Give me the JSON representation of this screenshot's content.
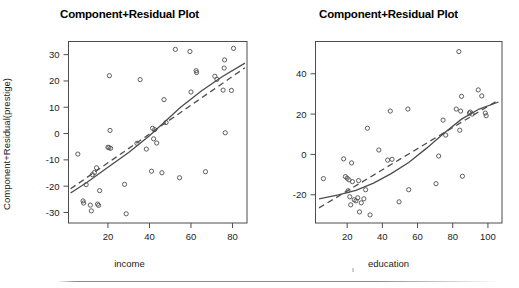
{
  "figure": {
    "background_color": "#ffffff",
    "ink_color": "#4d4d4d",
    "text_color": "#1c1c1c",
    "bottom_rule_visible": true
  },
  "panels": [
    {
      "id": "income-panel",
      "title": "Component+Residual Plot",
      "xlabel": "income",
      "ylabel": "Component+Residual(prestige)",
      "xticks": [
        20,
        40,
        60,
        80
      ],
      "yticks": [
        -30,
        -20,
        -10,
        0,
        10,
        20,
        30
      ],
      "xlim": [
        1,
        87
      ],
      "ylim": [
        -34,
        35
      ]
    },
    {
      "id": "education-panel",
      "title": "Component+Residual Plot",
      "xlabel": "education",
      "ylabel": "Component+Residual(prestige)",
      "xticks": [
        20,
        40,
        60,
        80,
        100
      ],
      "yticks": [
        -20,
        0,
        20,
        40
      ],
      "xlim": [
        2,
        108
      ],
      "ylim": [
        -34,
        56
      ]
    }
  ],
  "chart_data": [
    {
      "type": "scatter",
      "id": "income-panel",
      "title": "Component+Residual Plot",
      "xlabel": "income",
      "ylabel": "Component+Residual(prestige)",
      "xlim": [
        1,
        87
      ],
      "ylim": [
        -34,
        35
      ],
      "xticks": [
        20,
        40,
        60,
        80
      ],
      "yticks": [
        -30,
        -20,
        -10,
        0,
        10,
        20,
        30
      ],
      "grid": false,
      "legend": "none",
      "marker": "open-circle",
      "points": [
        {
          "x": 5.5,
          "y": -7.8
        },
        {
          "x": 8.0,
          "y": -25.6
        },
        {
          "x": 8.3,
          "y": -26.4
        },
        {
          "x": 9.5,
          "y": -19.4
        },
        {
          "x": 11.5,
          "y": -27.2
        },
        {
          "x": 12.0,
          "y": -29.4
        },
        {
          "x": 12.5,
          "y": -15.6
        },
        {
          "x": 13.5,
          "y": -14.8
        },
        {
          "x": 14.5,
          "y": -13.0
        },
        {
          "x": 15.0,
          "y": -26.8
        },
        {
          "x": 15.5,
          "y": -27.3
        },
        {
          "x": 16.0,
          "y": -21.7
        },
        {
          "x": 20.0,
          "y": -5.2
        },
        {
          "x": 20.5,
          "y": -5.4
        },
        {
          "x": 20.7,
          "y": 22.0
        },
        {
          "x": 21.0,
          "y": 1.2
        },
        {
          "x": 21.3,
          "y": -5.6
        },
        {
          "x": 28.0,
          "y": -19.3
        },
        {
          "x": 28.8,
          "y": -30.5
        },
        {
          "x": 34.0,
          "y": -3.7
        },
        {
          "x": 35.5,
          "y": 20.5
        },
        {
          "x": 38.5,
          "y": -5.9
        },
        {
          "x": 41.0,
          "y": -14.3
        },
        {
          "x": 41.5,
          "y": 2.0
        },
        {
          "x": 42.0,
          "y": -2.0
        },
        {
          "x": 42.5,
          "y": 1.5
        },
        {
          "x": 43.5,
          "y": -3.6
        },
        {
          "x": 46.0,
          "y": -14.9
        },
        {
          "x": 47.0,
          "y": 12.9
        },
        {
          "x": 48.0,
          "y": 4.2
        },
        {
          "x": 52.5,
          "y": 32.0
        },
        {
          "x": 54.5,
          "y": -16.8
        },
        {
          "x": 59.5,
          "y": 31.2
        },
        {
          "x": 60.0,
          "y": 15.8
        },
        {
          "x": 62.5,
          "y": 23.9
        },
        {
          "x": 62.7,
          "y": 23.2
        },
        {
          "x": 67.0,
          "y": -14.5
        },
        {
          "x": 71.5,
          "y": 21.8
        },
        {
          "x": 72.5,
          "y": 20.6
        },
        {
          "x": 75.5,
          "y": 16.5
        },
        {
          "x": 76.0,
          "y": 24.9
        },
        {
          "x": 76.2,
          "y": 28.0
        },
        {
          "x": 76.5,
          "y": 0.3
        },
        {
          "x": 79.5,
          "y": 16.4
        },
        {
          "x": 80.5,
          "y": 32.4
        }
      ],
      "fits": [
        {
          "name": "smooth",
          "style": "solid",
          "x": [
            2,
            10,
            20,
            30,
            40,
            47,
            55,
            65,
            75,
            86
          ],
          "y": [
            -22.6,
            -18.5,
            -12.8,
            -7.2,
            -0.8,
            4.2,
            10.0,
            16.2,
            21.6,
            26.8
          ]
        },
        {
          "name": "linear",
          "style": "dashed",
          "x": [
            2,
            86
          ],
          "y": [
            -21.0,
            25.0
          ]
        }
      ]
    },
    {
      "type": "scatter",
      "id": "education-panel",
      "title": "Component+Residual Plot",
      "xlabel": "education",
      "ylabel": "Component+Residual(prestige)",
      "xlim": [
        2,
        108
      ],
      "ylim": [
        -34,
        56
      ],
      "xticks": [
        20,
        40,
        60,
        80,
        100
      ],
      "yticks": [
        -20,
        0,
        20,
        40
      ],
      "grid": false,
      "legend": "none",
      "marker": "open-circle",
      "points": [
        {
          "x": 6.5,
          "y": -12.0
        },
        {
          "x": 18.0,
          "y": -2.2
        },
        {
          "x": 19.0,
          "y": -11.0
        },
        {
          "x": 20.0,
          "y": -11.8
        },
        {
          "x": 20.5,
          "y": -18.0
        },
        {
          "x": 21.0,
          "y": -12.6
        },
        {
          "x": 21.5,
          "y": -21.0
        },
        {
          "x": 22.0,
          "y": -25.0
        },
        {
          "x": 22.5,
          "y": -4.2
        },
        {
          "x": 23.0,
          "y": -13.5
        },
        {
          "x": 24.0,
          "y": -22.5
        },
        {
          "x": 25.0,
          "y": -23.0
        },
        {
          "x": 26.0,
          "y": -21.5
        },
        {
          "x": 26.5,
          "y": -13.0
        },
        {
          "x": 27.0,
          "y": -28.5
        },
        {
          "x": 28.0,
          "y": -24.0
        },
        {
          "x": 29.5,
          "y": -22.0
        },
        {
          "x": 30.5,
          "y": -17.5
        },
        {
          "x": 31.5,
          "y": 13.0
        },
        {
          "x": 33.0,
          "y": -30.0
        },
        {
          "x": 38.0,
          "y": 2.2
        },
        {
          "x": 43.0,
          "y": -2.8
        },
        {
          "x": 44.5,
          "y": 21.5
        },
        {
          "x": 45.5,
          "y": -2.4
        },
        {
          "x": 49.5,
          "y": -23.5
        },
        {
          "x": 54.5,
          "y": 22.5
        },
        {
          "x": 55.0,
          "y": -17.5
        },
        {
          "x": 70.5,
          "y": -14.5
        },
        {
          "x": 72.0,
          "y": -0.8
        },
        {
          "x": 74.5,
          "y": 17.0
        },
        {
          "x": 76.0,
          "y": 9.6
        },
        {
          "x": 82.0,
          "y": 22.5
        },
        {
          "x": 83.5,
          "y": 51.0
        },
        {
          "x": 84.0,
          "y": 12.0
        },
        {
          "x": 84.5,
          "y": 21.5
        },
        {
          "x": 85.0,
          "y": 28.8
        },
        {
          "x": 85.5,
          "y": -10.8
        },
        {
          "x": 89.5,
          "y": 20.5
        },
        {
          "x": 90.0,
          "y": 21.0
        },
        {
          "x": 91.0,
          "y": 20.0
        },
        {
          "x": 94.5,
          "y": 32.0
        },
        {
          "x": 96.5,
          "y": 29.0
        },
        {
          "x": 98.5,
          "y": 20.5
        },
        {
          "x": 99.0,
          "y": 19.2
        }
      ],
      "fits": [
        {
          "name": "smooth",
          "style": "solid",
          "x": [
            4,
            15,
            25,
            35,
            45,
            55,
            65,
            75,
            85,
            95,
            106
          ],
          "y": [
            -22.0,
            -20.0,
            -17.8,
            -14.2,
            -9.5,
            -4.0,
            3.0,
            10.5,
            17.5,
            22.5,
            26.0
          ]
        },
        {
          "name": "linear",
          "style": "dashed",
          "x": [
            4,
            106
          ],
          "y": [
            -26.5,
            27.0
          ]
        }
      ]
    }
  ]
}
